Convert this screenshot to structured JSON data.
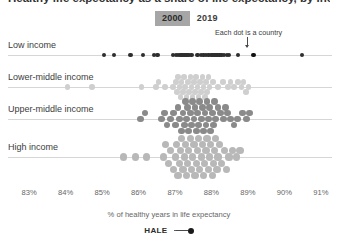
{
  "title": "Healthy life expectancy as a share of life expectancy, by income group",
  "year_toggle": {
    "options": [
      "2000",
      "2019"
    ],
    "selected": "2000",
    "active_color": "#a6a6a6",
    "inactive_color": "#ffffff"
  },
  "annotation": {
    "text": "Each dot is a country",
    "target_value": 89.15,
    "target_row": "Low income"
  },
  "legend": {
    "label": "HALE",
    "marker": "dot-line-dot"
  },
  "chart_data": {
    "type": "scatter",
    "variant": "beeswarm-strip",
    "title": "Healthy life expectancy as a share of life expectancy, by income group",
    "xlabel": "% of healthy years in life expectancy",
    "ylabel": "",
    "xlim": [
      82.75,
      91.25
    ],
    "xticks": [
      83,
      84,
      85,
      86,
      87,
      88,
      89,
      90,
      91
    ],
    "xticklabels": [
      "83%",
      "84%",
      "85%",
      "86%",
      "87%",
      "88%",
      "89%",
      "90%",
      "91%"
    ],
    "grid": false,
    "legend_position": "bottom-center",
    "selected_year": "2000",
    "note": "Each dot is a country",
    "series": [
      {
        "name": "Low income",
        "color": "#2e2e2e",
        "dot_size": 2.2,
        "values": [
          85.05,
          85.32,
          85.78,
          86.12,
          86.42,
          86.52,
          86.95,
          87.02,
          87.08,
          87.15,
          87.18,
          87.22,
          87.25,
          87.28,
          87.32,
          87.35,
          87.38,
          87.45,
          87.62,
          87.72,
          87.78,
          87.85,
          87.92,
          87.98,
          88.02,
          88.05,
          88.08,
          88.12,
          88.15,
          88.18,
          88.22,
          88.28,
          88.35,
          88.42,
          88.48,
          88.72,
          89.15,
          90.48
        ]
      },
      {
        "name": "Lower-middle income",
        "color": "#cfcfcf",
        "dot_size": 2.8,
        "values": [
          84.05,
          84.72,
          86.08,
          86.48,
          86.55,
          86.72,
          86.95,
          87.02,
          87.05,
          87.08,
          87.12,
          87.15,
          87.18,
          87.22,
          87.25,
          87.28,
          87.32,
          87.35,
          87.38,
          87.42,
          87.45,
          87.48,
          87.52,
          87.55,
          87.58,
          87.62,
          87.65,
          87.68,
          87.72,
          87.75,
          87.78,
          87.82,
          87.85,
          87.88,
          87.92,
          87.95,
          88.05,
          88.18,
          88.32,
          88.45,
          88.52,
          88.62,
          88.72,
          88.82,
          88.88,
          88.95,
          89.02
        ],
        "jitter": true
      },
      {
        "name": "Upper-middle income",
        "color": "#8a8a8a",
        "dot_size": 3.4,
        "values": [
          86.05,
          86.18,
          86.62,
          86.72,
          86.78,
          86.88,
          86.95,
          87.02,
          87.08,
          87.12,
          87.18,
          87.22,
          87.25,
          87.28,
          87.32,
          87.35,
          87.38,
          87.42,
          87.45,
          87.48,
          87.52,
          87.55,
          87.58,
          87.62,
          87.65,
          87.68,
          87.72,
          87.75,
          87.78,
          87.82,
          87.85,
          87.88,
          87.92,
          87.95,
          87.98,
          88.02,
          88.05,
          88.08,
          88.12,
          88.18,
          88.25,
          88.32,
          88.38,
          88.45,
          88.52,
          88.62,
          88.72,
          88.85,
          88.95,
          89.05
        ],
        "jitter": true
      },
      {
        "name": "High income",
        "color": "#b8b8b8",
        "dot_size": 3.6,
        "values": [
          85.58,
          85.92,
          86.22,
          86.68,
          86.75,
          86.82,
          86.88,
          86.95,
          87.02,
          87.05,
          87.08,
          87.12,
          87.15,
          87.18,
          87.22,
          87.25,
          87.28,
          87.32,
          87.35,
          87.38,
          87.42,
          87.45,
          87.48,
          87.52,
          87.55,
          87.58,
          87.62,
          87.65,
          87.68,
          87.72,
          87.75,
          87.78,
          87.82,
          87.85,
          87.88,
          87.92,
          87.95,
          87.98,
          88.02,
          88.05,
          88.08,
          88.12,
          88.15,
          88.18,
          88.22,
          88.28,
          88.35,
          88.42,
          88.48,
          88.58,
          88.68,
          88.78
        ],
        "jitter": true
      }
    ]
  }
}
